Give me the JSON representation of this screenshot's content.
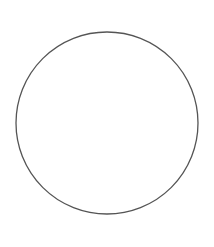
{
  "canvas": {
    "width": 214,
    "height": 247,
    "background": "#ffffff"
  },
  "shapes": [
    {
      "type": "circle",
      "cx": 107,
      "cy": 123,
      "r": 91,
      "fill": "none",
      "stroke": "#555555",
      "stroke_width": 1.3
    }
  ]
}
